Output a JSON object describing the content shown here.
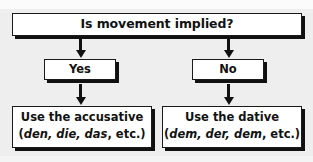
{
  "diagram": {
    "background_color": "#eeeeee",
    "box_fill_color": "#ffffff",
    "line_color": "#111111",
    "question": {
      "label": "Is movement implied?"
    },
    "branches": [
      {
        "id": "yes",
        "label": "Yes"
      },
      {
        "id": "no",
        "label": "No"
      }
    ],
    "results": [
      {
        "id": "accusative",
        "line1": "Use the accusative",
        "open_paren": "(",
        "articles": "den, die, das",
        "separator": ", ",
        "etc": "etc.",
        "close_paren": ")"
      },
      {
        "id": "dative",
        "line1": "Use the dative",
        "open_paren": "(",
        "articles": "dem, der, dem",
        "separator": ", ",
        "etc": "etc.",
        "close_paren": ")"
      }
    ],
    "arrows": [
      {
        "id": "question-to-yes",
        "from": "question",
        "to": "yes",
        "direction": "down"
      },
      {
        "id": "question-to-no",
        "from": "question",
        "to": "no",
        "direction": "down"
      },
      {
        "id": "yes-to-accusative",
        "from": "yes",
        "to": "accusative",
        "direction": "down"
      },
      {
        "id": "no-to-dative",
        "from": "no",
        "to": "dative",
        "direction": "down"
      }
    ]
  }
}
